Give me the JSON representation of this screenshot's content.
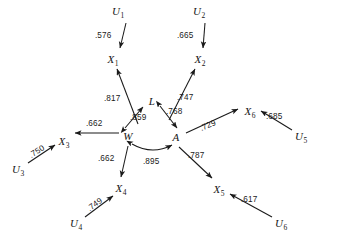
{
  "figure": {
    "type": "path-diagram",
    "width": 344,
    "height": 242,
    "background_color": "#ffffff",
    "line_color": "#1a1a1a"
  },
  "nodes": [
    {
      "id": "U1",
      "base": "U",
      "sub": "1",
      "x": 118,
      "y": 11
    },
    {
      "id": "U2",
      "base": "U",
      "sub": "2",
      "x": 199,
      "y": 11
    },
    {
      "id": "X1",
      "base": "X",
      "sub": "1",
      "x": 113,
      "y": 59
    },
    {
      "id": "X2",
      "base": "X",
      "sub": "2",
      "x": 200,
      "y": 59
    },
    {
      "id": "L",
      "base": "L",
      "sub": "",
      "x": 152,
      "y": 101
    },
    {
      "id": "W",
      "base": "W",
      "sub": "",
      "x": 128,
      "y": 136
    },
    {
      "id": "A",
      "base": "A",
      "sub": "",
      "x": 176,
      "y": 137
    },
    {
      "id": "X3",
      "base": "X",
      "sub": "3",
      "x": 64,
      "y": 141
    },
    {
      "id": "U3",
      "base": "U",
      "sub": "3",
      "x": 18,
      "y": 169
    },
    {
      "id": "X6",
      "base": "X",
      "sub": "6",
      "x": 250,
      "y": 111
    },
    {
      "id": "U5",
      "base": "U",
      "sub": "5",
      "x": 301,
      "y": 136
    },
    {
      "id": "X4",
      "base": "X",
      "sub": "4",
      "x": 121,
      "y": 188
    },
    {
      "id": "U4",
      "base": "U",
      "sub": "4",
      "x": 76,
      "y": 223
    },
    {
      "id": "X5",
      "base": "X",
      "sub": "5",
      "x": 219,
      "y": 189
    },
    {
      "id": "U6",
      "base": "U",
      "sub": "6",
      "x": 281,
      "y": 223
    }
  ],
  "edges": [
    {
      "id": "U1-X1",
      "from": "U1",
      "to": "X1",
      "coefficient": ".576",
      "arrow": "single",
      "curve": false,
      "x1": 126,
      "y1": 23,
      "x2": 120,
      "y2": 48,
      "label_x": 95,
      "label_y": 32,
      "label_rot": 0
    },
    {
      "id": "U2-X2",
      "from": "U2",
      "to": "X2",
      "coefficient": ".665",
      "arrow": "single",
      "curve": false,
      "x1": 205,
      "y1": 23,
      "x2": 203,
      "y2": 48,
      "label_x": 177,
      "label_y": 32,
      "label_rot": 0
    },
    {
      "id": "W-X1",
      "from": "W",
      "to": "X1",
      "coefficient": ".817",
      "arrow": "single",
      "curve": false,
      "x1": 138,
      "y1": 124,
      "x2": 117,
      "y2": 69,
      "label_x": 104,
      "label_y": 95,
      "label_rot": 0
    },
    {
      "id": "A-X2",
      "from": "A",
      "to": "X2",
      "coefficient": ".747",
      "arrow": "single",
      "curve": false,
      "x1": 169,
      "y1": 120,
      "x2": 195,
      "y2": 69,
      "label_x": 177,
      "label_y": 94,
      "label_rot": 0
    },
    {
      "id": "W-L",
      "from": "W",
      "to": "L",
      "coefficient": ".859",
      "arrow": "double",
      "curve": false,
      "x1": 125,
      "y1": 128,
      "x2": 143,
      "y2": 107,
      "label_x": 130,
      "label_y": 114,
      "label_rot": 0
    },
    {
      "id": "L-A",
      "from": "L",
      "to": "A",
      "coefficient": ".768",
      "arrow": "double",
      "curve": false,
      "x1": 160,
      "y1": 106,
      "x2": 177,
      "y2": 128,
      "label_x": 166,
      "label_y": 108,
      "label_rot": 0
    },
    {
      "id": "W-A",
      "from": "W",
      "to": "A",
      "coefficient": ".895",
      "arrow": "double",
      "curve": true,
      "x1": 132,
      "y1": 144,
      "x2": 172,
      "y2": 145,
      "label_x": 143,
      "label_y": 158,
      "label_rot": 0
    },
    {
      "id": "W-X3",
      "from": "W",
      "to": "X3",
      "coefficient": ".662",
      "arrow": "single",
      "curve": false,
      "x1": 119,
      "y1": 133,
      "x2": 75,
      "y2": 133,
      "label_x": 86,
      "label_y": 120,
      "label_rot": 0
    },
    {
      "id": "W-X4",
      "from": "W",
      "to": "X4",
      "coefficient": ".662",
      "arrow": "single",
      "curve": false,
      "x1": 128,
      "y1": 146,
      "x2": 121,
      "y2": 177,
      "label_x": 98,
      "label_y": 155,
      "label_rot": 0
    },
    {
      "id": "A-X5",
      "from": "A",
      "to": "X5",
      "coefficient": ".787",
      "arrow": "single",
      "curve": false,
      "x1": 179,
      "y1": 147,
      "x2": 212,
      "y2": 178,
      "label_x": 188,
      "label_y": 152,
      "label_rot": 0
    },
    {
      "id": "A-X6",
      "from": "A",
      "to": "X6",
      "coefficient": ".729",
      "arrow": "single",
      "curve": false,
      "x1": 186,
      "y1": 133,
      "x2": 238,
      "y2": 109,
      "label_x": 200,
      "label_y": 122,
      "label_rot": -23
    },
    {
      "id": "U3-X3",
      "from": "U3",
      "to": "X3",
      "coefficient": ".750",
      "arrow": "single",
      "curve": false,
      "x1": 28,
      "y1": 163,
      "x2": 55,
      "y2": 145,
      "label_x": 29,
      "label_y": 148,
      "label_rot": -33
    },
    {
      "id": "U4-X4",
      "from": "U4",
      "to": "X4",
      "coefficient": ".749",
      "arrow": "single",
      "curve": false,
      "x1": 85,
      "y1": 217,
      "x2": 113,
      "y2": 196,
      "label_x": 87,
      "label_y": 201,
      "label_rot": -36
    },
    {
      "id": "U5-X6",
      "from": "U5",
      "to": "X6",
      "coefficient": ".685",
      "arrow": "single",
      "curve": false,
      "x1": 292,
      "y1": 130,
      "x2": 261,
      "y2": 111,
      "label_x": 266,
      "label_y": 113,
      "label_rot": 0
    },
    {
      "id": "U6-X5",
      "from": "U6",
      "to": "X5",
      "coefficient": ".617",
      "arrow": "single",
      "curve": false,
      "x1": 272,
      "y1": 217,
      "x2": 230,
      "y2": 194,
      "label_x": 241,
      "label_y": 196,
      "label_rot": 0
    }
  ]
}
